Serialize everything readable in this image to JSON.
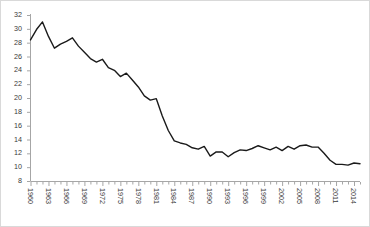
{
  "chart_data": {
    "type": "line",
    "title": "",
    "subtitle": "",
    "xlabel": "",
    "ylabel": "",
    "grid": false,
    "legend": "none",
    "legend_entries": [],
    "annotations": [],
    "line_color": "#1a1a1a",
    "background_color": "#ffffff",
    "axis_color": "#a6a6a6",
    "border_color": "#d9d9d9",
    "xlim": [
      1960,
      2015
    ],
    "ylim": [
      8,
      32
    ],
    "ytick_step": 2,
    "ytick_labels": [
      "32",
      "30",
      "28",
      "26",
      "24",
      "22",
      "20",
      "18",
      "16",
      "14",
      "12",
      "10",
      "8"
    ],
    "ytick_values": [
      32,
      30,
      28,
      26,
      24,
      22,
      20,
      18,
      16,
      14,
      12,
      10,
      8
    ],
    "xtick_labels": [
      "1960",
      "1963",
      "1966",
      "1969",
      "1972",
      "1975",
      "1978",
      "1981",
      "1984",
      "1987",
      "1990",
      "1993",
      "1996",
      "1999",
      "2002",
      "2005",
      "2008",
      "2011",
      "2014"
    ],
    "xtick_label_step": 3,
    "x": [
      1960,
      1961,
      1962,
      1963,
      1964,
      1965,
      1966,
      1967,
      1968,
      1969,
      1970,
      1971,
      1972,
      1973,
      1974,
      1975,
      1976,
      1977,
      1978,
      1979,
      1980,
      1981,
      1982,
      1983,
      1984,
      1985,
      1986,
      1987,
      1988,
      1989,
      1990,
      1991,
      1992,
      1993,
      1994,
      1995,
      1996,
      1997,
      1998,
      1999,
      2000,
      2001,
      2002,
      2003,
      2004,
      2005,
      2006,
      2007,
      2008,
      2009,
      2010,
      2011,
      2012,
      2013,
      2014,
      2015
    ],
    "values": [
      28.4,
      29.9,
      31.0,
      28.9,
      27.2,
      27.8,
      28.2,
      28.7,
      27.5,
      26.6,
      25.7,
      25.2,
      25.6,
      24.4,
      24.0,
      23.1,
      23.6,
      22.6,
      21.6,
      20.3,
      19.7,
      19.9,
      17.4,
      15.3,
      13.8,
      13.5,
      13.3,
      12.8,
      12.6,
      13.0,
      11.6,
      12.2,
      12.2,
      11.5,
      12.1,
      12.5,
      12.4,
      12.7,
      13.1,
      12.8,
      12.5,
      12.9,
      12.4,
      13.0,
      12.6,
      13.1,
      13.2,
      12.9,
      12.9,
      12.0,
      11.0,
      10.4,
      10.4,
      10.3,
      10.6,
      10.5
    ],
    "series_name": "value"
  }
}
